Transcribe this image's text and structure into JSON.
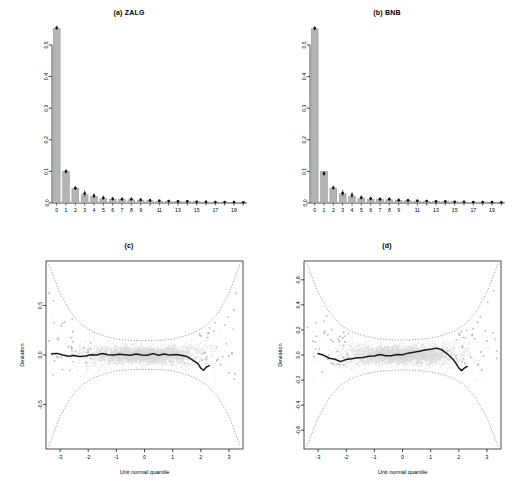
{
  "figure": {
    "width": 516,
    "height": 492,
    "background": "#ffffff",
    "layout": "2x2 panel grid: two rootogram bar charts on top, two worm (detrended Q-Q) plots below"
  },
  "panels": [
    {
      "id": "a",
      "title": "(a) ZALG"
    },
    {
      "id": "b",
      "title": "(b) BNB"
    },
    {
      "id": "c",
      "title": "(c)"
    },
    {
      "id": "d",
      "title": "(d)"
    }
  ],
  "colors": {
    "bar_fill": "#b4b4b4",
    "bar_edge": "#8a8a8a",
    "marker": "#111111",
    "cloud": "#d9d9d9",
    "band": "#6f6f6f",
    "worm_line": "#1a1a1a",
    "axis": "#000000"
  },
  "chart_data": [
    {
      "type": "bar",
      "panel": "a",
      "title": "(a) ZALG",
      "xlabel": "",
      "ylabel": "",
      "grid": false,
      "legend": null,
      "categories": [
        "0",
        "1",
        "2",
        "3",
        "4",
        "5",
        "6",
        "7",
        "8",
        "9",
        "10",
        "11",
        "12",
        "13",
        "14",
        "15",
        "16",
        "17",
        "18",
        "19",
        "20"
      ],
      "tick_labels": [
        "0",
        "1",
        "2",
        "3",
        "4",
        "5",
        "6",
        "7",
        "8",
        "9",
        "",
        "11",
        "",
        "13",
        "",
        "15",
        "",
        "17",
        "",
        "19",
        ""
      ],
      "ylim": [
        0,
        0.56
      ],
      "yticks": [
        0.0,
        0.1,
        0.2,
        0.3,
        0.4,
        0.5
      ],
      "ytick_labels": [
        "0.0",
        "0.1",
        "0.2",
        "0.3",
        "0.4",
        "0.5"
      ],
      "values": [
        0.553,
        0.099,
        0.046,
        0.026,
        0.021,
        0.014,
        0.012,
        0.011,
        0.01,
        0.009,
        0.007,
        0.006,
        0.005,
        0.005,
        0.004,
        0.004,
        0.003,
        0.003,
        0.003,
        0.002,
        0.002
      ],
      "observed_points": [
        0.554,
        0.1,
        0.047,
        0.03,
        0.023,
        0.016,
        0.013,
        0.012,
        0.012,
        0.01,
        0.008,
        0.007,
        0.006,
        0.005,
        0.005,
        0.004,
        0.004,
        0.003,
        0.003,
        0.003,
        0.002
      ],
      "error_low": [
        0.548,
        0.093,
        0.041,
        0.021,
        0.015,
        0.01,
        0.008,
        0.007,
        0.007,
        0.005,
        0.004,
        0.003,
        0.003,
        0.002,
        0.002,
        0.002,
        0.001,
        0.001,
        0.001,
        0.001,
        0.001
      ],
      "error_high": [
        0.56,
        0.107,
        0.054,
        0.039,
        0.031,
        0.023,
        0.019,
        0.018,
        0.018,
        0.015,
        0.013,
        0.011,
        0.01,
        0.009,
        0.008,
        0.007,
        0.007,
        0.006,
        0.006,
        0.005,
        0.004
      ]
    },
    {
      "type": "bar",
      "panel": "b",
      "title": "(b) BNB",
      "xlabel": "",
      "ylabel": "",
      "grid": false,
      "legend": null,
      "categories": [
        "0",
        "1",
        "2",
        "3",
        "4",
        "5",
        "6",
        "7",
        "8",
        "9",
        "10",
        "11",
        "12",
        "13",
        "14",
        "15",
        "16",
        "17",
        "18",
        "19",
        "20"
      ],
      "tick_labels": [
        "0",
        "1",
        "2",
        "3",
        "4",
        "5",
        "6",
        "7",
        "8",
        "9",
        "",
        "11",
        "",
        "13",
        "",
        "15",
        "",
        "17",
        "",
        "19",
        ""
      ],
      "ylim": [
        0,
        0.56
      ],
      "yticks": [
        0.0,
        0.1,
        0.2,
        0.3,
        0.4,
        0.5
      ],
      "ytick_labels": [
        "0.0",
        "0.1",
        "0.2",
        "0.3",
        "0.4",
        "0.5"
      ],
      "values": [
        0.551,
        0.1,
        0.047,
        0.029,
        0.021,
        0.015,
        0.012,
        0.011,
        0.01,
        0.008,
        0.007,
        0.006,
        0.005,
        0.005,
        0.004,
        0.004,
        0.003,
        0.003,
        0.003,
        0.002,
        0.002
      ],
      "observed_points": [
        0.553,
        0.093,
        0.048,
        0.031,
        0.025,
        0.017,
        0.014,
        0.012,
        0.012,
        0.009,
        0.008,
        0.007,
        0.006,
        0.005,
        0.005,
        0.004,
        0.004,
        0.003,
        0.003,
        0.003,
        0.002
      ],
      "error_low": [
        0.546,
        0.086,
        0.042,
        0.022,
        0.016,
        0.011,
        0.008,
        0.007,
        0.007,
        0.005,
        0.004,
        0.003,
        0.003,
        0.002,
        0.002,
        0.002,
        0.001,
        0.001,
        0.001,
        0.001,
        0.001
      ],
      "error_high": [
        0.559,
        0.101,
        0.055,
        0.041,
        0.034,
        0.024,
        0.02,
        0.018,
        0.018,
        0.014,
        0.013,
        0.011,
        0.01,
        0.009,
        0.008,
        0.007,
        0.007,
        0.006,
        0.006,
        0.005,
        0.004
      ]
    },
    {
      "type": "scatter",
      "panel": "c",
      "title": "(c)",
      "xlabel": "Unit normal quantile",
      "ylabel": "Deviation",
      "grid": false,
      "legend": null,
      "xlim": [
        -3.5,
        3.5
      ],
      "ylim": [
        -0.95,
        0.95
      ],
      "xticks": [
        -3,
        -2,
        -1,
        0,
        1,
        2,
        3
      ],
      "xtick_labels": [
        "-3",
        "-2",
        "-1",
        "0",
        "1",
        "2",
        "3"
      ],
      "yticks": [
        -0.5,
        0.0,
        0.5
      ],
      "ytick_labels": [
        "-0.5",
        "0.0",
        "0.5"
      ],
      "annotations": [
        "dotted pointwise confidence band flaring at both tails",
        "dense light-grey point cloud of bootstrap worms",
        "dark central worm close to zero, dipping near x = 2"
      ],
      "worm": {
        "x": [
          -3.3,
          -3.1,
          -2.9,
          -2.7,
          -2.5,
          -2.3,
          -2.1,
          -1.9,
          -1.7,
          -1.5,
          -1.3,
          -1.1,
          -0.9,
          -0.7,
          -0.5,
          -0.3,
          -0.1,
          0.1,
          0.3,
          0.5,
          0.7,
          0.9,
          1.1,
          1.3,
          1.5,
          1.7,
          1.9,
          2.0,
          2.1,
          2.2,
          2.3
        ],
        "y": [
          0.01,
          0.02,
          0.0,
          -0.01,
          0.0,
          -0.02,
          -0.01,
          0.0,
          0.0,
          0.01,
          0.0,
          0.0,
          0.01,
          0.0,
          0.0,
          0.01,
          0.0,
          0.0,
          0.01,
          0.0,
          0.01,
          0.0,
          0.01,
          0.0,
          -0.02,
          -0.05,
          -0.09,
          -0.13,
          -0.15,
          -0.12,
          -0.11
        ]
      },
      "band": {
        "x": [
          -3.4,
          -3.0,
          -2.6,
          -2.2,
          -1.8,
          -1.4,
          -1.0,
          -0.6,
          -0.2,
          0.2,
          0.6,
          1.0,
          1.4,
          1.8,
          2.2,
          2.6,
          3.0,
          3.4
        ],
        "upper": [
          0.92,
          0.62,
          0.42,
          0.3,
          0.23,
          0.19,
          0.16,
          0.15,
          0.145,
          0.145,
          0.15,
          0.16,
          0.19,
          0.23,
          0.3,
          0.42,
          0.62,
          0.92
        ],
        "lower": [
          -0.92,
          -0.62,
          -0.42,
          -0.3,
          -0.23,
          -0.19,
          -0.16,
          -0.15,
          -0.145,
          -0.145,
          -0.15,
          -0.16,
          -0.19,
          -0.23,
          -0.3,
          -0.42,
          -0.62,
          -0.92
        ]
      }
    },
    {
      "type": "scatter",
      "panel": "d",
      "title": "(d)",
      "xlabel": "Unit normal quantile",
      "ylabel": "Deviation",
      "grid": false,
      "legend": null,
      "xlim": [
        -3.5,
        3.5
      ],
      "ylim": [
        -0.75,
        0.75
      ],
      "xticks": [
        -3,
        -2,
        -1,
        0,
        1,
        2,
        3
      ],
      "xtick_labels": [
        "-3",
        "-2",
        "-1",
        "0",
        "1",
        "2",
        "3"
      ],
      "yticks": [
        -0.6,
        -0.4,
        -0.2,
        0.0,
        0.2,
        0.4,
        0.6
      ],
      "ytick_labels": [
        "-0.6",
        "-0.4",
        "-0.2",
        "0.0",
        "0.2",
        "0.4",
        "0.6"
      ],
      "annotations": [
        "dotted pointwise confidence band flaring at both tails",
        "dense light-grey point cloud of bootstrap worms",
        "dark central worm with a bump near x = 1.2 and a dip near x = 2"
      ],
      "worm": {
        "x": [
          -3.0,
          -2.8,
          -2.6,
          -2.4,
          -2.2,
          -2.0,
          -1.8,
          -1.6,
          -1.4,
          -1.2,
          -1.0,
          -0.8,
          -0.6,
          -0.4,
          -0.2,
          0.0,
          0.2,
          0.4,
          0.6,
          0.8,
          1.0,
          1.2,
          1.4,
          1.6,
          1.8,
          1.9,
          2.0,
          2.1,
          2.2,
          2.3
        ],
        "y": [
          0.01,
          0.0,
          -0.02,
          -0.04,
          -0.05,
          -0.04,
          -0.03,
          -0.02,
          -0.02,
          -0.01,
          -0.01,
          0.0,
          0.0,
          -0.01,
          0.0,
          0.0,
          0.01,
          0.02,
          0.03,
          0.04,
          0.05,
          0.06,
          0.04,
          0.01,
          -0.03,
          -0.07,
          -0.1,
          -0.12,
          -0.1,
          -0.09
        ]
      },
      "band": {
        "x": [
          -3.4,
          -3.0,
          -2.6,
          -2.2,
          -1.8,
          -1.4,
          -1.0,
          -0.6,
          -0.2,
          0.2,
          0.6,
          1.0,
          1.4,
          1.8,
          2.2,
          2.6,
          3.0,
          3.4
        ],
        "upper": [
          0.73,
          0.5,
          0.34,
          0.24,
          0.185,
          0.155,
          0.135,
          0.125,
          0.12,
          0.12,
          0.125,
          0.135,
          0.155,
          0.185,
          0.24,
          0.34,
          0.5,
          0.73
        ],
        "lower": [
          -0.73,
          -0.5,
          -0.34,
          -0.24,
          -0.185,
          -0.155,
          -0.135,
          -0.125,
          -0.12,
          -0.12,
          -0.125,
          -0.135,
          -0.155,
          -0.185,
          -0.24,
          -0.34,
          -0.5,
          -0.73
        ]
      }
    }
  ]
}
